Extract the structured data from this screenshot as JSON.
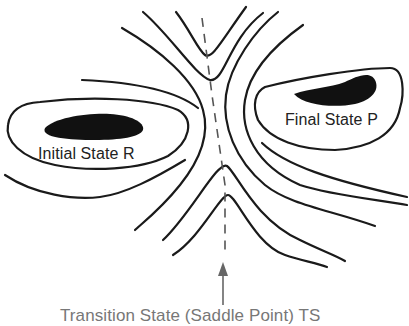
{
  "diagram": {
    "labels": {
      "initial_state": "Initial State R",
      "final_state": "Final State P",
      "caption": "Transition State (Saddle Point) TS"
    },
    "elements": {
      "reactant_well": "filled minimum region (left)",
      "product_well": "filled minimum region (right)",
      "reaction_path": "dashed line through saddle",
      "arrow": "upward arrow pointing to saddle"
    },
    "colors": {
      "line": "#1a1a1a",
      "dashed": "#555555",
      "blob": "#111111",
      "background": "#ffffff"
    }
  }
}
